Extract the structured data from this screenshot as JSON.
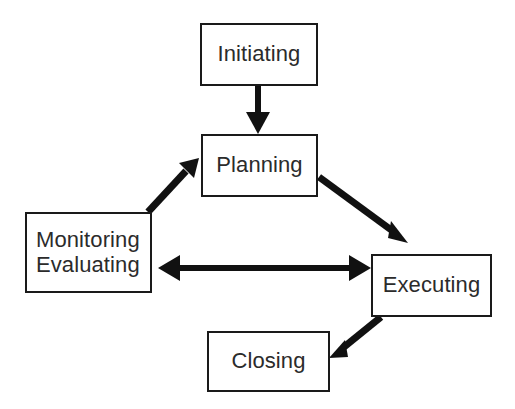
{
  "diagram": {
    "background_color": "#ffffff",
    "box_border_color": "#1a1a1a",
    "text_color": "#2b2b2b",
    "arrow_color": "#111111",
    "nodes": [
      {
        "id": "initiating",
        "label": "Initiating",
        "x": 200,
        "y": 23,
        "w": 118,
        "h": 63
      },
      {
        "id": "planning",
        "label": "Planning",
        "x": 201,
        "y": 134,
        "w": 117,
        "h": 63
      },
      {
        "id": "monitoring",
        "label": "Monitoring\nEvaluating",
        "line1": "Monitoring",
        "line2": "Evaluating",
        "x": 25,
        "y": 212,
        "w": 127,
        "h": 81
      },
      {
        "id": "executing",
        "label": "Executing",
        "x": 371,
        "y": 254,
        "w": 121,
        "h": 63
      },
      {
        "id": "closing",
        "label": "Closing",
        "x": 207,
        "y": 331,
        "w": 123,
        "h": 61
      }
    ],
    "edges": [
      {
        "id": "initiating-to-planning",
        "from": "initiating",
        "to": "planning",
        "direction": "one-way",
        "orientation": "vertical-down"
      },
      {
        "id": "monitoring-to-planning",
        "from": "monitoring",
        "to": "planning",
        "direction": "one-way",
        "orientation": "diagonal-up-right"
      },
      {
        "id": "planning-to-executing",
        "from": "planning",
        "to": "executing",
        "direction": "one-way",
        "orientation": "diagonal-down-right"
      },
      {
        "id": "monitoring-to-executing",
        "from": "monitoring",
        "to": "executing",
        "direction": "bidirectional",
        "orientation": "horizontal"
      },
      {
        "id": "executing-to-closing",
        "from": "executing",
        "to": "closing",
        "direction": "one-way",
        "orientation": "diagonal-down-left"
      }
    ]
  }
}
